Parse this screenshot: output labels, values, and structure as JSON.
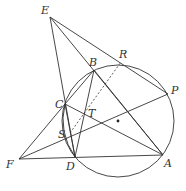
{
  "diagram": {
    "type": "geometry",
    "circle": {
      "cx": 118,
      "cy": 121,
      "r": 56,
      "center_dot": true
    },
    "points": {
      "E": {
        "label": "E",
        "x": 50,
        "y": 17
      },
      "B": {
        "label": "B",
        "x": 94,
        "y": 70
      },
      "R": {
        "label": "R",
        "x": 121,
        "y": 62
      },
      "P": {
        "label": "P",
        "x": 168,
        "y": 94
      },
      "C": {
        "label": "C",
        "x": 65,
        "y": 104
      },
      "T": {
        "label": "T",
        "x": 86,
        "y": 118
      },
      "S": {
        "label": "S",
        "x": 70,
        "y": 133
      },
      "F": {
        "label": "F",
        "x": 19,
        "y": 159
      },
      "D": {
        "label": "D",
        "x": 75,
        "y": 157
      },
      "A": {
        "label": "A",
        "x": 163,
        "y": 155
      }
    },
    "labels": [
      "E",
      "B",
      "R",
      "P",
      "C",
      "T",
      "S",
      "F",
      "D",
      "A"
    ],
    "segments_solid": [
      "E-P",
      "E-A",
      "E-D",
      "B-D",
      "B-A",
      "C-B",
      "C-A",
      "C-D",
      "F-C",
      "F-P",
      "F-A",
      "D-A"
    ],
    "segments_dashed": [
      "S-R"
    ],
    "colors": {
      "stroke": "#333333",
      "background": "#ffffff"
    }
  }
}
